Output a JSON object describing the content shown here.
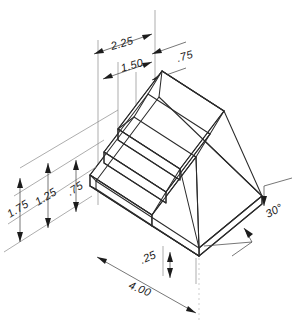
{
  "drawing": {
    "type": "isometric-technical-drawing",
    "subject": "stepped block with chamfered side and base plate",
    "background_color": "#ffffff",
    "line_color": "#2b2b2b",
    "dimension_line_color": "#4a4a4a",
    "extension_line_color": "#8a8a8a",
    "text_color": "#1a1a1a"
  },
  "dimensions": {
    "top_width_overall": "2.25",
    "top_width_inner": "1.50",
    "top_width_right": ".75",
    "left_height_overall": "1.75",
    "left_height_middle": "1.25",
    "left_height_lower": ".75",
    "base_thickness": ".25",
    "base_length": "4.00",
    "chamfer_angle": "30°"
  },
  "labels": [
    {
      "name": "dim-2-25",
      "text": "2.25"
    },
    {
      "name": "dim-1-50",
      "text": "1.50"
    },
    {
      "name": "dim-0-75-top",
      "text": ".75"
    },
    {
      "name": "dim-1-75",
      "text": "1.75"
    },
    {
      "name": "dim-1-25",
      "text": "1.25"
    },
    {
      "name": "dim-0-75-left",
      "text": ".75"
    },
    {
      "name": "dim-0-25",
      "text": ".25"
    },
    {
      "name": "dim-4-00",
      "text": "4.00"
    },
    {
      "name": "dim-30-deg",
      "text": "30°"
    }
  ]
}
